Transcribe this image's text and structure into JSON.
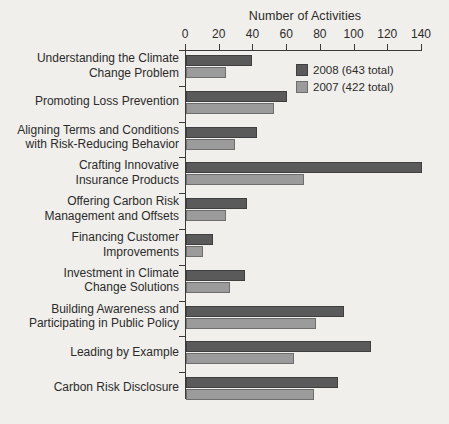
{
  "chart_data": {
    "type": "bar",
    "orientation": "horizontal",
    "title": "",
    "xlabel": "Number of Activities",
    "ylabel": "",
    "xlim": [
      0,
      140
    ],
    "xticks": [
      0,
      20,
      40,
      60,
      80,
      100,
      120,
      140
    ],
    "grid": false,
    "legend_position": "top-right",
    "categories": [
      "Understanding the Climate Change Problem",
      "Promoting Loss Prevention",
      "Aligning Terms and Conditions with Risk-Reducing Behavior",
      "Crafting Innovative Insurance Products",
      "Offering Carbon Risk Management and Offsets",
      "Financing Customer Improvements",
      "Investment in Climate Change Solutions",
      "Building Awareness and Participating in Public Policy",
      "Leading by Example",
      "Carbon Risk Disclosure"
    ],
    "category_lines": [
      [
        "Understanding the Climate",
        "Change Problem"
      ],
      [
        "Promoting Loss Prevention"
      ],
      [
        "Aligning Terms and Conditions",
        "with Risk-Reducing Behavior"
      ],
      [
        "Crafting Innovative",
        "Insurance Products"
      ],
      [
        "Offering Carbon Risk",
        "Management and Offsets"
      ],
      [
        "Financing Customer",
        "Improvements"
      ],
      [
        "Investment in Climate",
        "Change Solutions"
      ],
      [
        "Building Awareness and",
        "Participating in Public Policy"
      ],
      [
        "Leading by Example"
      ],
      [
        "Carbon Risk Disclosure"
      ]
    ],
    "series": [
      {
        "name": "2008 (643 total)",
        "year": "2008",
        "total": 643,
        "color": "#5a5a5a",
        "values": [
          39,
          60,
          42,
          140,
          36,
          16,
          35,
          94,
          110,
          90
        ]
      },
      {
        "name": "2007 (422 total)",
        "year": "2007",
        "total": 422,
        "color": "#9b9b9b",
        "values": [
          24,
          52,
          29,
          70,
          24,
          10,
          26,
          77,
          64,
          76
        ]
      }
    ]
  },
  "legend": {
    "items": [
      {
        "label": "2008 (643 total)",
        "color": "#5a5a5a"
      },
      {
        "label": "2007 (422 total)",
        "color": "#9b9b9b"
      }
    ]
  },
  "axis": {
    "title": "Number of Activities",
    "tick_labels": [
      "0",
      "20",
      "40",
      "60",
      "80",
      "100",
      "120",
      "140"
    ]
  },
  "colors": {
    "background": "#f1efeb",
    "axis": "#3a3a3a",
    "text": "#2b2b2b",
    "series_2008": "#5a5a5a",
    "series_2007": "#9b9b9b"
  }
}
